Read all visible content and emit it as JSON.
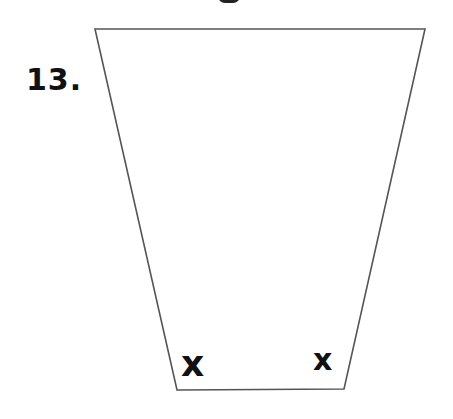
{
  "problem": {
    "number_label": "13.",
    "shape": "trapezoid",
    "vertices": {
      "top_left": [
        95,
        29
      ],
      "top_right": [
        425,
        29
      ],
      "bottom_right": [
        344,
        389
      ],
      "bottom_left": [
        177,
        390
      ]
    },
    "angle_marks": [
      {
        "position": "bottom-left",
        "label": "x"
      },
      {
        "position": "bottom-right",
        "label": "x"
      }
    ],
    "stroke_color": "#555555"
  }
}
